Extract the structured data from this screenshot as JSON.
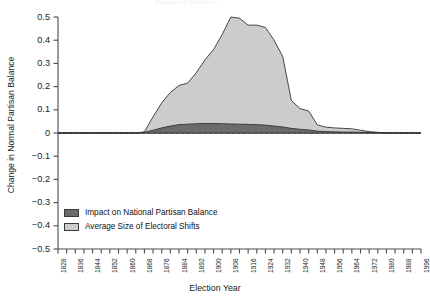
{
  "figure": {
    "cutoff_title": "Realigning Elections",
    "xlabel": "Election Year",
    "ylabel": "Change in Normal Partisan Balance"
  },
  "legend": {
    "position": "inside-lower-left",
    "entries": [
      {
        "label": "Impact on National Partisan Balance",
        "color": "#6b6b6b"
      },
      {
        "label": "Average Size of Electoral Shifts",
        "color": "#cccccc"
      }
    ]
  },
  "chart_data": {
    "type": "area",
    "stacked": false,
    "title": "Realigning Elections",
    "xlabel": "Election Year",
    "ylabel": "Change in Normal Partisan Balance",
    "xlim": [
      1828,
      1996
    ],
    "ylim": [
      -0.5,
      0.5
    ],
    "grid": false,
    "zero_line": {
      "value": 0,
      "style": "dashed"
    },
    "ytick_labels": [
      "0.5",
      "0.4",
      "0.3",
      "0.2",
      "0.1",
      "0",
      "-0.1",
      "-0.2",
      "-0.3",
      "-0.4",
      "-0.5"
    ],
    "ytick_values": [
      0.5,
      0.4,
      0.3,
      0.2,
      0.1,
      0,
      -0.1,
      -0.2,
      -0.3,
      -0.4,
      -0.5
    ],
    "xtick_values": [
      1828,
      1832,
      1836,
      1840,
      1844,
      1848,
      1852,
      1856,
      1860,
      1864,
      1868,
      1872,
      1876,
      1880,
      1884,
      1888,
      1892,
      1896,
      1900,
      1904,
      1908,
      1912,
      1916,
      1920,
      1924,
      1928,
      1932,
      1936,
      1940,
      1944,
      1948,
      1952,
      1956,
      1960,
      1964,
      1968,
      1972,
      1976,
      1980,
      1984,
      1988,
      1992,
      1996
    ],
    "xtick_labels": [
      "1828",
      "1836",
      "1844",
      "1852",
      "1860",
      "1868",
      "1876",
      "1884",
      "1892",
      "1900",
      "1908",
      "1916",
      "1924",
      "1932",
      "1940",
      "1948",
      "1956",
      "1964",
      "1972",
      "1980",
      "1988",
      "1996"
    ],
    "xtick_labels_values": [
      1828,
      1836,
      1844,
      1852,
      1860,
      1868,
      1876,
      1884,
      1892,
      1900,
      1908,
      1916,
      1924,
      1932,
      1940,
      1948,
      1956,
      1964,
      1972,
      1980,
      1988,
      1996
    ],
    "x": [
      1828,
      1832,
      1836,
      1840,
      1844,
      1848,
      1852,
      1856,
      1860,
      1864,
      1868,
      1872,
      1876,
      1880,
      1884,
      1888,
      1892,
      1896,
      1900,
      1904,
      1908,
      1912,
      1916,
      1920,
      1924,
      1928,
      1932,
      1936,
      1940,
      1944,
      1948,
      1952,
      1956,
      1960,
      1964,
      1968,
      1972,
      1976,
      1980,
      1984,
      1988,
      1992,
      1996
    ],
    "series": [
      {
        "name": "Average Size of Electoral Shifts",
        "color": "#cccccc",
        "edge": "#333333",
        "values": [
          0,
          0,
          0,
          0,
          0,
          0,
          0,
          0,
          0,
          0,
          0.005,
          0.07,
          0.13,
          0.175,
          0.205,
          0.215,
          0.26,
          0.315,
          0.36,
          0.425,
          0.5,
          0.495,
          0.465,
          0.465,
          0.455,
          0.4,
          0.33,
          0.14,
          0.105,
          0.095,
          0.035,
          0.025,
          0.022,
          0.02,
          0.018,
          0.012,
          0.006,
          0.003,
          0,
          0,
          0,
          0,
          0
        ]
      },
      {
        "name": "Impact on National Partisan Balance",
        "color": "#6b6b6b",
        "edge": "#333333",
        "values": [
          0,
          0,
          0,
          0,
          0,
          0,
          0,
          0,
          0,
          0,
          0.003,
          0.012,
          0.022,
          0.03,
          0.036,
          0.038,
          0.04,
          0.041,
          0.041,
          0.04,
          0.039,
          0.038,
          0.037,
          0.036,
          0.034,
          0.03,
          0.026,
          0.02,
          0.016,
          0.013,
          0.008,
          0.006,
          0.005,
          0.004,
          0.004,
          0.003,
          0.002,
          0.001,
          0,
          0,
          0,
          0,
          0
        ]
      }
    ]
  }
}
